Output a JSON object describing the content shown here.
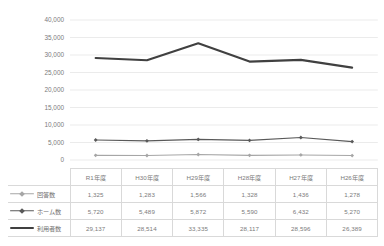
{
  "chart_title": "",
  "axis": {
    "y_ticks": [
      "40,000",
      "35,000",
      "30,000",
      "25,000",
      "20,000",
      "15,000",
      "10,000",
      "5,000",
      "0"
    ],
    "ymin": 0,
    "ymax": 40000,
    "ystep": 5000
  },
  "colors": {
    "series_kaitousu": "#a6a6a6",
    "series_homesu": "#595959",
    "series_riyousha": "#404040",
    "gridline": "#e6e6e6",
    "table_border": "#d9d9d9",
    "text": "#7b7b7b"
  },
  "table": {
    "corner_label": "",
    "headers": [
      "R1年度",
      "H30年度",
      "H29年度",
      "H28年度",
      "H27年度",
      "H26年度"
    ],
    "rows": [
      {
        "label": "回答数",
        "marker": "diamond",
        "line": "thin",
        "values": [
          "1,325",
          "1,283",
          "1,566",
          "1,328",
          "1,436",
          "1,278"
        ]
      },
      {
        "label": "ホーム数",
        "marker": "diamond",
        "line": "thin",
        "values": [
          "5,720",
          "5,489",
          "5,872",
          "5,590",
          "6,432",
          "5,270"
        ]
      },
      {
        "label": "利用者数",
        "marker": "none",
        "line": "thick",
        "values": [
          "29,137",
          "28,514",
          "33,335",
          "28,117",
          "28,596",
          "26,389"
        ]
      }
    ]
  },
  "chart_data": {
    "type": "line",
    "title": "",
    "xlabel": "",
    "ylabel": "",
    "ylim": [
      0,
      40000
    ],
    "ytick_step": 5000,
    "grid": "horizontal",
    "legend": "in-table",
    "categories": [
      "R1年度",
      "H30年度",
      "H29年度",
      "H28年度",
      "H27年度",
      "H26年度"
    ],
    "series": [
      {
        "name": "回答数",
        "color": "#a6a6a6",
        "marker": "diamond",
        "line_width": 1.1,
        "values": [
          1325,
          1283,
          1566,
          1328,
          1436,
          1278
        ]
      },
      {
        "name": "ホーム数",
        "color": "#595959",
        "marker": "diamond",
        "line_width": 1.2,
        "values": [
          5720,
          5489,
          5872,
          5590,
          6432,
          5270
        ]
      },
      {
        "name": "利用者数",
        "color": "#404040",
        "marker": "none",
        "line_width": 2.1,
        "values": [
          29137,
          28514,
          33335,
          28117,
          28596,
          26389
        ]
      }
    ]
  }
}
